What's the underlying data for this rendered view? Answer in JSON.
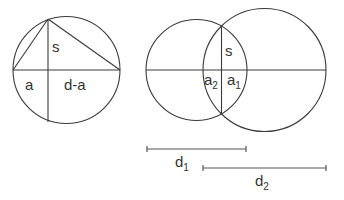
{
  "diagram": {
    "left_figure": {
      "circle": {
        "cx": 66.5,
        "cy": 70,
        "r": 53.5
      },
      "labels": {
        "s": "s",
        "a": "a",
        "d_minus_a": "d-a"
      }
    },
    "right_figure": {
      "circle1": {
        "cx": 196.5,
        "cy": 70,
        "r": 50.5
      },
      "circle2": {
        "cx": 264.5,
        "cy": 70,
        "r": 61.5
      },
      "labels": {
        "s": "s",
        "a2_base": "a",
        "a2_sub": "2",
        "a1_base": "a",
        "a1_sub": "1"
      }
    },
    "measures": {
      "d1": {
        "base": "d",
        "sub": "1"
      },
      "d2": {
        "base": "d",
        "sub": "2"
      }
    },
    "colors": {
      "line": "#3a3a3a",
      "text": "#333333",
      "background": "#ffffff"
    }
  }
}
